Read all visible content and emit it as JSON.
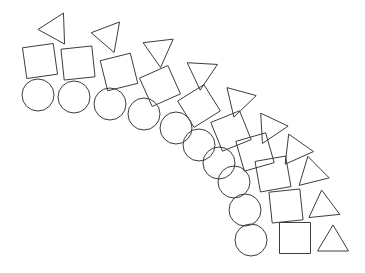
{
  "figure": {
    "canvas": {
      "width": 365,
      "height": 273
    },
    "style": {
      "background_color": "#ffffff",
      "stroke_color": "#3c3c3c",
      "stroke_width": 1,
      "fill": "none"
    },
    "shape_kinds": [
      "circle",
      "square",
      "triangle"
    ],
    "group_count": 10,
    "rotation_range_degrees": [
      -92,
      2
    ]
  },
  "chart_data": {
    "type": "scatter",
    "xlabel": "",
    "ylabel": "",
    "xlim": [
      0,
      365
    ],
    "ylim": [
      0,
      273
    ],
    "grid": false,
    "legend": "none",
    "groups": [
      {
        "index": 1,
        "rotation": -92,
        "circle": {
          "cx": 38,
          "cy": 95,
          "r": 16
        },
        "square": {
          "cx": 40,
          "cy": 61,
          "size": 31,
          "rotation": -8
        },
        "triangle": {
          "cx": 51,
          "cy": 29,
          "size": 31,
          "rotation": -92
        }
      },
      {
        "index": 2,
        "rotation": -82,
        "circle": {
          "cx": 74,
          "cy": 97,
          "r": 16
        },
        "square": {
          "cx": 78,
          "cy": 63,
          "size": 31,
          "rotation": -6
        },
        "triangle": {
          "cx": 104,
          "cy": 35,
          "size": 31,
          "rotation": -80
        }
      },
      {
        "index": 3,
        "rotation": -72,
        "circle": {
          "cx": 110,
          "cy": 104,
          "r": 16
        },
        "square": {
          "cx": 119,
          "cy": 72,
          "size": 31,
          "rotation": -14
        },
        "triangle": {
          "cx": 155,
          "cy": 48,
          "size": 31,
          "rotation": -66
        }
      },
      {
        "index": 4,
        "rotation": -62,
        "circle": {
          "cx": 144,
          "cy": 114,
          "r": 16
        },
        "square": {
          "cx": 160,
          "cy": 86,
          "size": 31,
          "rotation": -24
        },
        "triangle": {
          "cx": 198,
          "cy": 70,
          "size": 31,
          "rotation": -56
        }
      },
      {
        "index": 5,
        "rotation": -52,
        "circle": {
          "cx": 176,
          "cy": 128,
          "r": 16
        },
        "square": {
          "cx": 199,
          "cy": 106,
          "size": 31,
          "rotation": -32
        },
        "triangle": {
          "cx": 236,
          "cy": 97,
          "size": 31,
          "rotation": -44
        }
      },
      {
        "index": 6,
        "rotation": -42,
        "circle": {
          "cx": 199,
          "cy": 145,
          "r": 16
        },
        "square": {
          "cx": 231,
          "cy": 131,
          "size": 31,
          "rotation": -22
        },
        "triangle": {
          "cx": 268,
          "cy": 124,
          "size": 31,
          "rotation": -34
        }
      },
      {
        "index": 7,
        "rotation": -32,
        "circle": {
          "cx": 219,
          "cy": 163,
          "r": 16
        },
        "square": {
          "cx": 255,
          "cy": 152,
          "size": 31,
          "rotation": -16
        },
        "triangle": {
          "cx": 294,
          "cy": 146,
          "size": 31,
          "rotation": -24
        }
      },
      {
        "index": 8,
        "rotation": -22,
        "circle": {
          "cx": 234,
          "cy": 182,
          "r": 16
        },
        "square": {
          "cx": 273,
          "cy": 174,
          "size": 31,
          "rotation": -10
        },
        "triangle": {
          "cx": 311,
          "cy": 169,
          "size": 31,
          "rotation": -14
        }
      },
      {
        "index": 9,
        "rotation": -12,
        "circle": {
          "cx": 245,
          "cy": 210,
          "r": 16
        },
        "square": {
          "cx": 286,
          "cy": 206,
          "size": 31,
          "rotation": -6
        },
        "triangle": {
          "cx": 323,
          "cy": 203,
          "size": 31,
          "rotation": -6
        }
      },
      {
        "index": 10,
        "rotation": 2,
        "circle": {
          "cx": 251,
          "cy": 240,
          "r": 16
        },
        "square": {
          "cx": 295,
          "cy": 238,
          "size": 31,
          "rotation": 0
        },
        "triangle": {
          "cx": 333,
          "cy": 238,
          "size": 31,
          "rotation": 0
        }
      }
    ]
  }
}
